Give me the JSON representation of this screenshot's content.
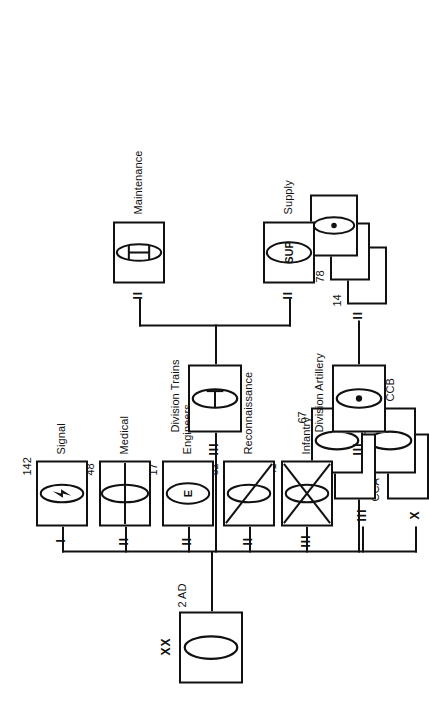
{
  "diagram": {
    "line_color": "#111111",
    "background": "#ffffff",
    "orientation": "rotated-90"
  },
  "root": {
    "designation": "2 AD",
    "echelon": "XX",
    "symbol": "armor-oval",
    "name": ""
  },
  "combat_commands": {
    "echelon": "X",
    "front": {
      "designation": "CCB",
      "symbol": "armor-oval"
    },
    "back": {
      "designation": "CCA",
      "symbol": "none"
    }
  },
  "armor_regiments": {
    "echelon": "III",
    "front": {
      "designation": "67",
      "symbol": "armor-oval"
    },
    "back": {
      "designation": "66",
      "symbol": "none"
    }
  },
  "branches": [
    {
      "designation": "41",
      "name": "Infantry",
      "echelon": "III",
      "symbol": "mech-infantry"
    },
    {
      "designation": "82",
      "name": "Reconnaissance",
      "echelon": "II",
      "symbol": "armored-cavalry"
    },
    {
      "designation": "17",
      "name": "Engineers",
      "echelon": "II",
      "symbol": "engineer-E"
    },
    {
      "designation": "48",
      "name": "Medical",
      "echelon": "II",
      "symbol": "medical-bar"
    },
    {
      "designation": "142",
      "name": "Signal",
      "echelon": "I",
      "symbol": "signal-bolt"
    }
  ],
  "division_artillery": {
    "name": "Division Artillery",
    "echelon": "III",
    "symbol": "artillery-dot",
    "subordinate_echelon": "II",
    "battalions": [
      {
        "designation": "14",
        "symbol": "none"
      },
      {
        "designation": "78",
        "symbol": "none"
      },
      {
        "designation": "92",
        "symbol": "artillery-dot"
      }
    ]
  },
  "division_trains": {
    "name": "Division Trains",
    "echelon": "III",
    "symbol": "trains-T",
    "children": [
      {
        "name": "Supply",
        "echelon": "II",
        "symbol": "supply-sup",
        "inner_text": "SUP"
      },
      {
        "name": "Maintenance",
        "echelon": "II",
        "symbol": "maintenance-ibar"
      }
    ]
  }
}
